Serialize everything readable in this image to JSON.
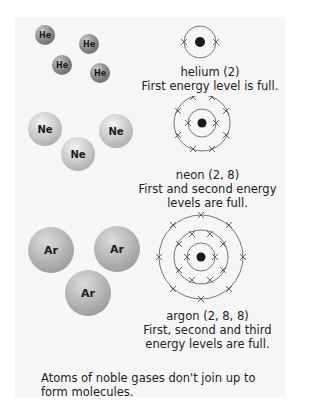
{
  "helium": {
    "symbol": "He",
    "atom_labels": [
      "He",
      "He",
      "He",
      "He"
    ],
    "name_config": "helium (2)",
    "description": "First energy level is full.",
    "shells": [
      2
    ]
  },
  "neon": {
    "symbol": "Ne",
    "atom_labels": [
      "Ne",
      "Ne",
      "Ne"
    ],
    "name_config": "neon (2, 8)",
    "description_line1": "First and second energy",
    "description_line2": "levels are full.",
    "shells": [
      2,
      8
    ]
  },
  "argon": {
    "symbol": "Ar",
    "atom_labels": [
      "Ar",
      "Ar",
      "Ar"
    ],
    "name_config": "argon (2, 8, 8)",
    "description_line1": "First, second and third",
    "description_line2": "energy levels are full.",
    "shells": [
      2,
      8,
      8
    ]
  },
  "footer": {
    "text": "Atoms of noble gases don't join up to form molecules."
  },
  "colors": {
    "panel_bg": "#f6f6f6",
    "nucleus": "#1a1a1a",
    "orbit": "#555555"
  }
}
